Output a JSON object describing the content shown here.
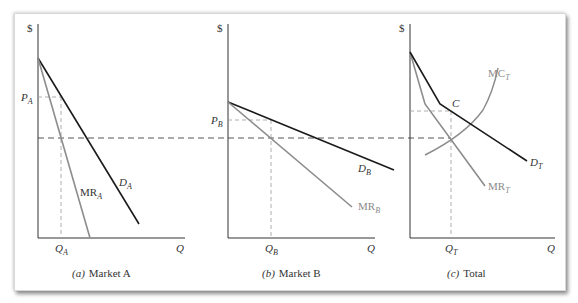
{
  "figure": {
    "dashed_marginal_cost_level_label": "",
    "panels": [
      {
        "id": "a",
        "caption_letter": "(a)",
        "caption_text": "Market A",
        "y_axis_label": "$",
        "x_axis_label": "Q",
        "price_label": "P",
        "price_sub": "A",
        "quantity_label": "Q",
        "quantity_sub": "A",
        "demand_label": "D",
        "demand_sub": "A",
        "mr_label": "MR",
        "mr_sub": "A"
      },
      {
        "id": "b",
        "caption_letter": "(b)",
        "caption_text": "Market B",
        "y_axis_label": "$",
        "x_axis_label": "Q",
        "price_label": "P",
        "price_sub": "B",
        "quantity_label": "Q",
        "quantity_sub": "B",
        "demand_label": "D",
        "demand_sub": "B",
        "mr_label": "MR",
        "mr_sub": "B"
      },
      {
        "id": "c",
        "caption_letter": "(c)",
        "caption_text": "Total",
        "y_axis_label": "$",
        "x_axis_label": "Q",
        "point_label": "C",
        "quantity_label": "Q",
        "quantity_sub": "T",
        "demand_label": "D",
        "demand_sub": "T",
        "mr_label": "MR",
        "mr_sub": "T",
        "mc_label": "MC",
        "mc_sub": "T"
      }
    ],
    "colors": {
      "demand": "#1a1a1a",
      "marginal": "#8c8c8c",
      "axis": "#333333",
      "dashed": "#555555",
      "dashed_light": "#9a9a9a"
    }
  }
}
